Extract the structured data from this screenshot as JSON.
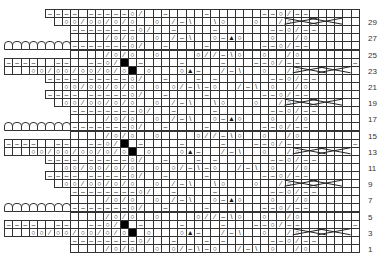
{
  "chart": {
    "cols": 43,
    "rows": 30,
    "origin_x": 4,
    "origin_y": 9,
    "cell_w": 8.25,
    "cell_h": 8.1,
    "legend_codes": {
      " ": "knit (empty square)",
      "-": "purl",
      "o": "yarn over",
      "/": "k2tog",
      "\\": "ssk",
      "A": "sk2p (centered double decrease)",
      "#": "no stitch (black)",
      "n": "scalloped edge",
      "x": "cable cross",
      ".": "outside chart"
    },
    "row_labels": [
      "29",
      "27",
      "25",
      "23",
      "21",
      "19",
      "17",
      "15",
      "13",
      "11",
      "9",
      "7",
      "5",
      "3",
      "1"
    ],
    "grid": [
      ".....---- -----o/  -    -      --o/--      - ",
      "...... oo/oo/o/o  o /-\\  \\o   o  /o  x  x  - ",
      "........--------o/  -    -      --o/--      - ",
      "........    /o/o  o /-\\  o-Ao   o  /o       - ",
      "nnnnnnnn-------o/  -    -      --o/--      - ",
      "........    /o/o  o    o//-\\o  o  /o       - ",
      "----  --  --o/# -    -    -   --o/--      - ",
      "   oo/oo/oo/o/o# o   oA-  /-\\  o  /o  x  x  - ",
      ".....---- -----o/  -   - -      --o/--      - ",
      "...... oo/oo/o/o  o o/-\\-o  /-\\ o  /o       - ",
      ".....---- -----o/  -    -      --o/--      - ",
      "...... oo/oo/o/o  o /-\\  \\o   o  /o  x  x  - ",
      "........--------o/  -    -      --o/--      - ",
      "........    /o/o  o /-\\  o-Ao   o  /o       - ",
      "nnnnnnnn-------o/  -    -      --o/--      - ",
      "........    /o/o  o    o//-\\o  o  /o       - ",
      "----  --  --o/# -    -    -   --o/--      - ",
      "   oo/oo/oo/o/o# o   oA-  /-\\  o  /o  x  x  - ",
      ".....---- -----o/  -   - -      --o/--      - ",
      "...... oo/oo/o/o  o o/-\\-o  /-\\ o  /o       - ",
      ".....---- -----o/  -    -      --o/--      - ",
      "...... oo/oo/o/o  o /-\\  \\o   o  /o  x  x  - ",
      "........--------o/  -    -      --o/--      - ",
      "........    /o/o  o /-\\  o-Ao   o  /o       - ",
      "nnnnnnnn-------o/  -    -      --o/--      - ",
      "........    /o/o  o    o//-\\o  o  /o       - ",
      "----  --  --o/# -    -    -   --o/--      - ",
      "   oo/oo/oo/o/o# o   oA-  /-\\  o  /o  x  x  - ",
      "........--------o/  -   - -     --o/--      - ",
      "........    /o/o  o o/-\\-o  /-\\ o  /o       - "
    ]
  },
  "symbols": {
    "o": "○",
    "/": "⁄",
    "\\": "\\",
    "-": "–",
    "A": "▲",
    "x": ""
  }
}
